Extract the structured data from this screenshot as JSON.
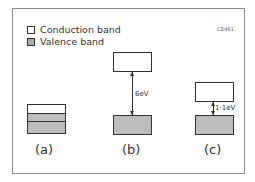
{
  "figure": {
    "code": "CD461",
    "legend": [
      {
        "label": "Conduction band",
        "swatch": "#ffffff"
      },
      {
        "label": "Valence band",
        "swatch": "#aaaaaa"
      }
    ],
    "panels": [
      {
        "label": "(a)",
        "description": "overlapping bands",
        "gap": ""
      },
      {
        "label": "(b)",
        "description": "insulator",
        "gap": "6eV"
      },
      {
        "label": "(c)",
        "description": "semiconductor",
        "gap": "1·1eV"
      }
    ]
  }
}
